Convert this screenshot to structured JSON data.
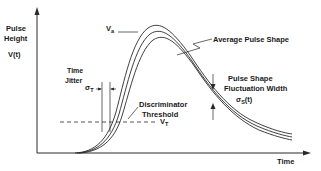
{
  "diagram": {
    "y_axis_label_line1": "Pulse",
    "y_axis_label_line2": "Height",
    "y_axis_function": "V(t)",
    "x_axis_label": "Time",
    "peak_label": "V",
    "peak_label_sub": "a",
    "average_label": "Average Pulse Shape",
    "time_jitter_line1": "Time",
    "time_jitter_line2": "Jitter",
    "sigma_t": "σ",
    "sigma_t_sub": "T",
    "discriminator_line1": "Discriminator",
    "discriminator_line2": "Threshold",
    "threshold_label": "V",
    "threshold_label_sub": "T",
    "fluct_line1": "Pulse Shape",
    "fluct_line2": "Fluctuation Width",
    "sigma_s": "σ",
    "sigma_s_sub": "S",
    "sigma_s_arg": "(t)"
  }
}
